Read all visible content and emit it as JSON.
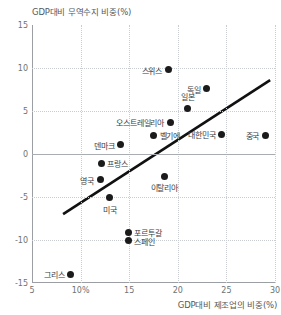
{
  "chart_data": {
    "type": "scatter",
    "title": "",
    "ylabel": "GDP대비 무역수지 비중(%)",
    "xlabel": "GDP대비 제조업의 비중(%)",
    "xlim": [
      5,
      30
    ],
    "ylim": [
      -15,
      15
    ],
    "xticks": [
      "5",
      "10%",
      "15",
      "20",
      "25",
      "30"
    ],
    "xtick_values": [
      5,
      10,
      15,
      20,
      25,
      30
    ],
    "yticks": [
      "15",
      "10",
      "5",
      "0",
      "-5",
      "-10",
      "-15"
    ],
    "ytick_values": [
      15,
      10,
      5,
      0,
      -5,
      -10,
      -15
    ],
    "grid": true,
    "legend": "none",
    "zero_line": 0,
    "point_color": "#1b1b1b",
    "grid_color": "#c9ccd0",
    "axis_color": "#9b9ea2",
    "trend_line": {
      "color": "#111111",
      "width": 2.6,
      "x_start": 8.2,
      "y_start": -7.0,
      "x_end": 29.5,
      "y_end": 8.6
    },
    "points": [
      {
        "name": "스위스",
        "x": 19.0,
        "y": 9.8,
        "label_pos": "left"
      },
      {
        "name": "독일",
        "x": 23.0,
        "y": 7.6,
        "label_pos": "left"
      },
      {
        "name": "일본",
        "x": 21.0,
        "y": 5.3,
        "label_pos": "above"
      },
      {
        "name": "오스트레일리아",
        "x": 19.2,
        "y": 3.7,
        "label_pos": "left"
      },
      {
        "name": "벨기에",
        "x": 17.5,
        "y": 2.2,
        "label_pos": "right"
      },
      {
        "name": "덴마크",
        "x": 14.1,
        "y": 1.1,
        "label_pos": "left"
      },
      {
        "name": "대한민국",
        "x": 24.5,
        "y": 2.3,
        "label_pos": "left"
      },
      {
        "name": "중국",
        "x": 29.0,
        "y": 2.2,
        "label_pos": "left"
      },
      {
        "name": "프랑스",
        "x": 12.1,
        "y": -1.1,
        "label_pos": "right"
      },
      {
        "name": "영국",
        "x": 12.0,
        "y": -3.0,
        "label_pos": "left"
      },
      {
        "name": "이탈리아",
        "x": 18.6,
        "y": -2.6,
        "label_pos": "below"
      },
      {
        "name": "미국",
        "x": 13.0,
        "y": -5.1,
        "label_pos": "below"
      },
      {
        "name": "포르투갈",
        "x": 14.9,
        "y": -9.1,
        "label_pos": "right"
      },
      {
        "name": "스페인",
        "x": 14.9,
        "y": -10.1,
        "label_pos": "right"
      },
      {
        "name": "그리스",
        "x": 9.0,
        "y": -14.0,
        "label_pos": "left"
      }
    ]
  }
}
